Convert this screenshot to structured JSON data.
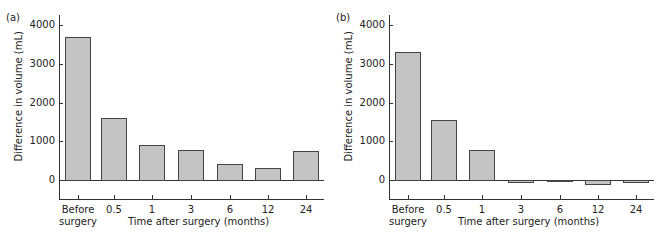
{
  "chart_data": [
    {
      "type": "bar",
      "panel": "(a)",
      "title": "",
      "xlabel": "Time after surgery (months)",
      "ylabel": "Difference in volume (mL)",
      "categories": [
        "Before surgery",
        "0.5",
        "1",
        "3",
        "6",
        "12",
        "24"
      ],
      "values": [
        3700,
        1600,
        900,
        780,
        420,
        310,
        750
      ],
      "yticks": [
        "0",
        "1000",
        "2000",
        "3000",
        "4000"
      ],
      "ylim": [
        -500,
        4000
      ],
      "grid": false,
      "legend": null
    },
    {
      "type": "bar",
      "panel": "(b)",
      "title": "",
      "xlabel": "Time after surgery (months)",
      "ylabel": "Difference in volume (mL)",
      "categories": [
        "Before surgery",
        "0.5",
        "1",
        "3",
        "6",
        "12",
        "24"
      ],
      "values": [
        3300,
        1550,
        770,
        -50,
        -10,
        -100,
        -40
      ],
      "yticks": [
        "0",
        "1000",
        "2000",
        "3000",
        "4000"
      ],
      "ylim": [
        -500,
        4000
      ],
      "grid": false,
      "legend": null
    }
  ],
  "panels": [
    {
      "label": "(a)",
      "ylabel": "Difference in volume (mL)",
      "xlabel": "Time after surgery (months)",
      "yticks": [
        "4000",
        "3000",
        "2000",
        "1000",
        "0"
      ],
      "categories": [
        "Before\nsurgery",
        "0.5",
        "1",
        "3",
        "6",
        "12",
        "24"
      ]
    },
    {
      "label": "(b)",
      "ylabel": "Difference in volume (mL)",
      "xlabel": "Time after surgery (months)",
      "yticks": [
        "4000",
        "3000",
        "2000",
        "1000",
        "0"
      ],
      "categories": [
        "Before\nsurgery",
        "0.5",
        "1",
        "3",
        "6",
        "12",
        "24"
      ]
    }
  ],
  "colors": {
    "bar_fill": "#c4c4c4",
    "bar_stroke": "#444444",
    "axis": "#333333"
  }
}
